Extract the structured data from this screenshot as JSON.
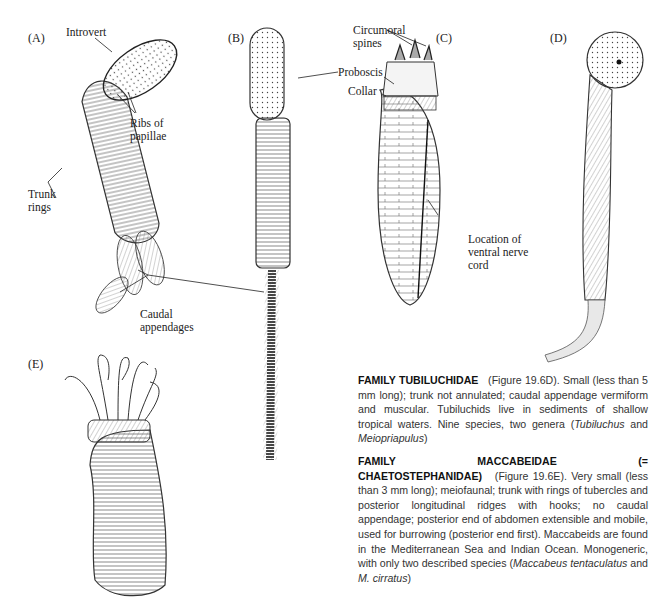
{
  "figure": {
    "panels": [
      {
        "id": "A",
        "label": "(A)"
      },
      {
        "id": "B",
        "label": "(B)"
      },
      {
        "id": "C",
        "label": "(C)"
      },
      {
        "id": "D",
        "label": "(D)"
      },
      {
        "id": "E",
        "label": "(E)"
      }
    ],
    "callouts": {
      "introvert": "Introvert",
      "ribs_1": "Ribs of",
      "ribs_2": "papillae",
      "trunk_1": "Trunk",
      "trunk_2": "rings",
      "caudal_1": "Caudal",
      "caudal_2": "appendages",
      "proboscis": "Proboscis",
      "circumoral_1": "Circumoral",
      "circumoral_2": "spines",
      "collar": "Collar",
      "nerve_1": "Location of",
      "nerve_2": "ventral nerve",
      "nerve_3": "cord"
    }
  },
  "text": {
    "tubiluchidae": {
      "heading": "FAMILY TUBILUCHIDAE",
      "body_1": "(Figure 19.6D). Small (less than 5 mm long); trunk not annulated; caudal appendage vermiform and muscular. Tubiluchids live in sediments of shallow tropical waters. Nine species, two genera (",
      "genus_1": "Tubiluchus",
      "and": " and ",
      "genus_2": "Meiopriapulus",
      "close": ")"
    },
    "maccabeidae": {
      "heading": "FAMILY MACCABEIDAE (= CHAETOSTEPHANIDAE)",
      "body_1": "(Figure 19.6E). Very small (less than 3 mm long); meiofaunal; trunk with rings of tubercles and posterior longitudinal ridges with hooks; no caudal appendage; posterior end of abdomen extensible and mobile, used for burrowing (posterior end first). Maccabeids are found in the Mediterranean Sea and Indian Ocean. Monogeneric, with only two described species (",
      "species_1": "Maccabeus tentaculatus",
      "and": " and ",
      "species_2": "M. cirratus",
      "close": ")"
    }
  }
}
